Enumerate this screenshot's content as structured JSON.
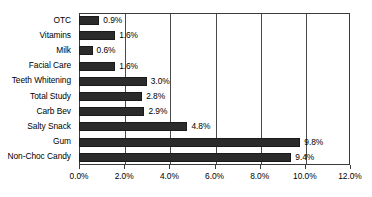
{
  "chart_data": {
    "type": "bar",
    "orientation": "horizontal",
    "title": "",
    "subtitle": "",
    "xlabel": "",
    "ylabel": "",
    "categories": [
      "OTC",
      "Vitamins",
      "Milk",
      "Facial Care",
      "Teeth Whitening",
      "Total Study",
      "Carb Bev",
      "Salty Snack",
      "Gum",
      "Non-Choc Candy"
    ],
    "values": [
      0.9,
      1.6,
      0.6,
      1.6,
      3.0,
      2.8,
      2.9,
      4.8,
      9.8,
      9.4
    ],
    "data_labels": [
      "0.9%",
      "1.6%",
      "0.6%",
      "1.6%",
      "3.0%",
      "2.8%",
      "2.9%",
      "4.8%",
      "9.8%",
      "9.4%"
    ],
    "xlim": [
      0.0,
      12.0
    ],
    "xticks": [
      0.0,
      2.0,
      4.0,
      6.0,
      8.0,
      10.0,
      12.0
    ],
    "xtick_labels": [
      "0.0%",
      "2.0%",
      "4.0%",
      "6.0%",
      "8.0%",
      "10.0%",
      "12.0%"
    ],
    "grid": "vertical",
    "legend": false,
    "legend_position": "none",
    "bar_color": "#2b2b2b",
    "axis_color": "#3b3b3b",
    "gridline_color": "#4a4a4a",
    "background_color": "#ffffff",
    "text_color": "#000000"
  }
}
